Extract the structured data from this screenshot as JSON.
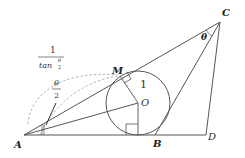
{
  "diagram": {
    "type": "geometry",
    "points": {
      "A": {
        "label": "A",
        "x": 24,
        "y": 135
      },
      "B": {
        "label": "B",
        "x": 155,
        "y": 135
      },
      "C": {
        "label": "C",
        "x": 220,
        "y": 22
      },
      "D": {
        "label": "D",
        "x": 206,
        "y": 135
      },
      "M": {
        "label": "M",
        "x": 120,
        "y": 76
      },
      "O": {
        "label": "O",
        "x": 138,
        "y": 103
      }
    },
    "circle": {
      "center": "O",
      "radius": 32
    },
    "labels": {
      "theta": "θ",
      "half_theta_num": "θ",
      "half_theta_den": "2",
      "radius_label": "1",
      "frac_num": "1",
      "frac_den_text": "tan",
      "frac_den_sup_num": "θ",
      "frac_den_sup_den": "2"
    },
    "colors": {
      "line": "#555555",
      "dashed": "#aaaaaa",
      "text": "#222222"
    }
  }
}
